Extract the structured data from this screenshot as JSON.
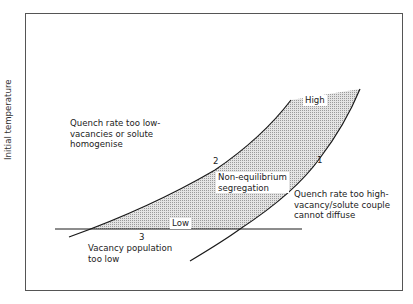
{
  "diagram": {
    "y_axis_label": "Initial temperature",
    "regions": {
      "upper_left": [
        "Quench rate too low-",
        "vacancies or solute",
        "homogenise"
      ],
      "center": [
        "Non-equilibrium",
        "segregation"
      ],
      "right": [
        "Quench rate too high-",
        "vacancy/solute couple",
        "cannot diffuse"
      ],
      "bottom": [
        "Vacancy population",
        "too low"
      ]
    },
    "curve_labels": {
      "curve1": "1",
      "curve2": "2",
      "line3": "3"
    },
    "band_labels": {
      "high": "High",
      "low": "Low"
    },
    "colors": {
      "line": "#1a1a1a",
      "shade": "#c8c8c8",
      "frame": "#555555"
    }
  }
}
